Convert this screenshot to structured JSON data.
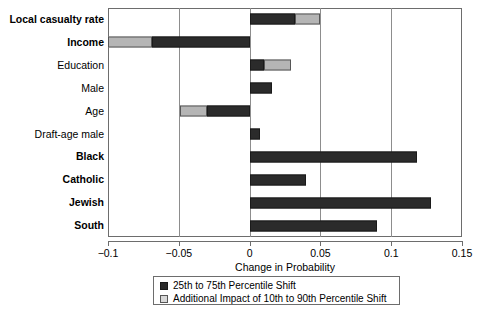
{
  "chart_data": {
    "type": "bar",
    "orientation": "horizontal",
    "title": "",
    "xlabel": "Change in Probability",
    "ylabel": "",
    "xlim": [
      -0.1,
      0.15
    ],
    "xticks": [
      "-0.1",
      "-0.05",
      "0",
      "0.05",
      "0.1",
      "0.15"
    ],
    "xtick_values": [
      -0.1,
      -0.05,
      0,
      0.05,
      0.1,
      0.15
    ],
    "grid": "vertical",
    "legend_position": "below-axis-center",
    "categories": [
      "Local casualty rate",
      "Income",
      "Education",
      "Male",
      "Age",
      "Draft-age male",
      "Black",
      "Catholic",
      "Jewish",
      "South"
    ],
    "category_emphasis": [
      true,
      true,
      false,
      false,
      false,
      false,
      true,
      true,
      true,
      true
    ],
    "series": [
      {
        "name": "25th to 75th Percentile Shift",
        "color": "#2b2b2b",
        "values": [
          0.032,
          -0.069,
          0.01,
          0.016,
          -0.03,
          0.007,
          0.118,
          0.04,
          0.128,
          0.09
        ]
      },
      {
        "name": "Additional Impact of 10th to 90th Percentile Shift",
        "color": "#b5b5b5",
        "values": [
          0.05,
          -0.1,
          0.029,
          0.016,
          -0.049,
          0.007,
          0.118,
          0.04,
          0.128,
          0.09
        ]
      }
    ],
    "bars": [
      {
        "label": "Local casualty rate",
        "dark_start": 0.0,
        "dark_end": 0.032,
        "light_start": 0.032,
        "light_end": 0.05
      },
      {
        "label": "Income",
        "dark_start": -0.069,
        "dark_end": 0.0,
        "light_start": -0.1,
        "light_end": -0.069
      },
      {
        "label": "Education",
        "dark_start": 0.0,
        "dark_end": 0.01,
        "light_start": 0.01,
        "light_end": 0.029
      },
      {
        "label": "Male",
        "dark_start": 0.0,
        "dark_end": 0.016,
        "light_start": null,
        "light_end": null
      },
      {
        "label": "Age",
        "dark_start": -0.03,
        "dark_end": 0.0,
        "light_start": -0.049,
        "light_end": -0.03
      },
      {
        "label": "Draft-age male",
        "dark_start": 0.0,
        "dark_end": 0.007,
        "light_start": null,
        "light_end": null
      },
      {
        "label": "Black",
        "dark_start": 0.0,
        "dark_end": 0.118,
        "light_start": null,
        "light_end": null
      },
      {
        "label": "Catholic",
        "dark_start": 0.0,
        "dark_end": 0.04,
        "light_start": null,
        "light_end": null
      },
      {
        "label": "Jewish",
        "dark_start": 0.0,
        "dark_end": 0.128,
        "light_start": null,
        "light_end": null
      },
      {
        "label": "South",
        "dark_start": 0.0,
        "dark_end": 0.09,
        "light_start": null,
        "light_end": null
      }
    ],
    "legend": [
      {
        "swatch": "dark",
        "label": "25th to 75th Percentile Shift"
      },
      {
        "swatch": "light",
        "label": "Additional Impact of 10th to 90th Percentile Shift"
      }
    ]
  }
}
